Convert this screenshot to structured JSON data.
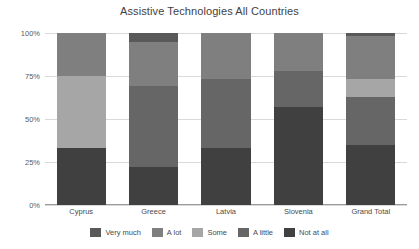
{
  "chart_data": {
    "type": "bar",
    "subtype": "stacked-bar-100-percent",
    "title": "Assistive Technologies All Countries",
    "xlabel": "",
    "ylabel": "",
    "ylim": [
      0,
      100
    ],
    "ytick_labels": [
      "0%",
      "25%",
      "50%",
      "75%",
      "100%"
    ],
    "ytick_values": [
      0,
      25,
      50,
      75,
      100
    ],
    "grid": true,
    "legend_position": "bottom",
    "categories": [
      "Cyprus",
      "Greece",
      "Latvia",
      "Slovenia",
      "Grand Total"
    ],
    "series": [
      {
        "name": "Very much",
        "color": "#595959",
        "values": [
          0,
          5,
          0,
          0,
          2
        ]
      },
      {
        "name": "A lot",
        "color": "#7f7f7f",
        "values": [
          25,
          26,
          27,
          22,
          25
        ]
      },
      {
        "name": "Some",
        "color": "#a6a6a6",
        "values": [
          42,
          0,
          0,
          0,
          10
        ]
      },
      {
        "name": "A little",
        "color": "#666666",
        "values": [
          0,
          47,
          40,
          21,
          28
        ]
      },
      {
        "name": "Not at all",
        "color": "#404040",
        "values": [
          33,
          22,
          33,
          57,
          35
        ]
      }
    ]
  },
  "axis": {
    "ticks": [
      {
        "label": "100%",
        "value": 100
      },
      {
        "label": "75%",
        "value": 75
      },
      {
        "label": "50%",
        "value": 50
      },
      {
        "label": "25%",
        "value": 25
      },
      {
        "label": "0%",
        "value": 0
      }
    ]
  },
  "legend": {
    "items": [
      {
        "label": "Very much",
        "color": "#595959"
      },
      {
        "label": "A lot",
        "color": "#7f7f7f"
      },
      {
        "label": "Some",
        "color": "#a6a6a6"
      },
      {
        "label": "A little",
        "color": "#666666"
      },
      {
        "label": "Not at all",
        "color": "#404040"
      }
    ]
  }
}
